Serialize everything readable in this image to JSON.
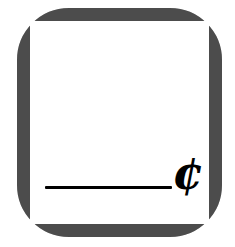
{
  "graphic": {
    "title": "Cent amount fill-in note",
    "type": "icon",
    "background_color": "#ffffff"
  },
  "card": {
    "name": "rounded note card",
    "border_color": "#4b4b4b",
    "fill_color": "#ffffff",
    "border_width_px": 13,
    "corner_radius_px": 52
  },
  "field": {
    "rule_label": "",
    "rule_color": "#000000",
    "currency_symbol": "¢",
    "currency_name": "cent-sign",
    "currency_color": "#000000"
  }
}
